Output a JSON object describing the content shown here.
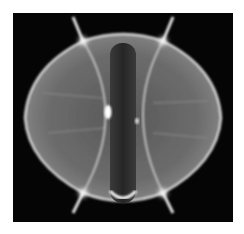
{
  "image": {
    "subject": "plasma-photograph",
    "description": "Grayscale photograph of a glowing plasma cross-section inside a spherical tokamak with a central column",
    "colors": {
      "background": "#ffffff",
      "frame": "#050505",
      "plasma_fill": "#6a6a6a",
      "plasma_edge": "#d8d8d8",
      "central_column": "#2e2e2e",
      "hotspot": "#ffffff"
    }
  }
}
